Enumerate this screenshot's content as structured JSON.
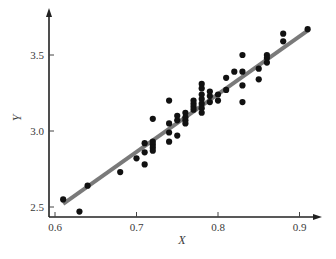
{
  "chart_data": {
    "type": "scatter",
    "title": "",
    "xlabel": "X",
    "ylabel": "Y",
    "xlim": [
      0.6,
      0.92
    ],
    "ylim": [
      2.45,
      3.78
    ],
    "xticks": [
      0.6,
      0.7,
      0.8,
      0.9
    ],
    "xtick_labels": [
      "0.6",
      "0.7",
      "0.8",
      "0.9"
    ],
    "yticks": [
      2.5,
      3.0,
      3.5
    ],
    "ytick_labels": [
      "2.5",
      "3.0",
      "3.5"
    ],
    "grid": false,
    "legend": null,
    "colors": {
      "points": "#111111",
      "fit_line": "#7a7a7a",
      "axis": "#222222"
    },
    "series": [
      {
        "name": "observations",
        "type": "scatter",
        "points": [
          [
            0.61,
            2.55
          ],
          [
            0.63,
            2.47
          ],
          [
            0.64,
            2.64
          ],
          [
            0.68,
            2.73
          ],
          [
            0.7,
            2.82
          ],
          [
            0.71,
            2.78
          ],
          [
            0.71,
            2.86
          ],
          [
            0.71,
            2.92
          ],
          [
            0.72,
            2.91
          ],
          [
            0.72,
            2.93
          ],
          [
            0.72,
            2.89
          ],
          [
            0.72,
            2.87
          ],
          [
            0.72,
            3.08
          ],
          [
            0.74,
            3.2
          ],
          [
            0.74,
            3.05
          ],
          [
            0.74,
            2.99
          ],
          [
            0.74,
            2.93
          ],
          [
            0.75,
            3.07
          ],
          [
            0.75,
            3.1
          ],
          [
            0.75,
            2.97
          ],
          [
            0.76,
            3.07
          ],
          [
            0.76,
            3.12
          ],
          [
            0.76,
            3.09
          ],
          [
            0.76,
            3.05
          ],
          [
            0.77,
            3.2
          ],
          [
            0.77,
            3.18
          ],
          [
            0.77,
            3.16
          ],
          [
            0.77,
            3.14
          ],
          [
            0.78,
            3.31
          ],
          [
            0.78,
            3.28
          ],
          [
            0.78,
            3.24
          ],
          [
            0.78,
            3.21
          ],
          [
            0.78,
            3.18
          ],
          [
            0.78,
            3.15
          ],
          [
            0.78,
            3.12
          ],
          [
            0.79,
            3.26
          ],
          [
            0.79,
            3.23
          ],
          [
            0.79,
            3.19
          ],
          [
            0.8,
            3.24
          ],
          [
            0.8,
            3.2
          ],
          [
            0.81,
            3.35
          ],
          [
            0.81,
            3.27
          ],
          [
            0.82,
            3.39
          ],
          [
            0.83,
            3.5
          ],
          [
            0.83,
            3.39
          ],
          [
            0.83,
            3.3
          ],
          [
            0.83,
            3.19
          ],
          [
            0.85,
            3.41
          ],
          [
            0.85,
            3.34
          ],
          [
            0.86,
            3.5
          ],
          [
            0.86,
            3.48
          ],
          [
            0.86,
            3.45
          ],
          [
            0.88,
            3.64
          ],
          [
            0.88,
            3.59
          ],
          [
            0.91,
            3.67
          ]
        ]
      },
      {
        "name": "fitted line",
        "type": "line",
        "points": [
          [
            0.61,
            2.52
          ],
          [
            0.91,
            3.66
          ]
        ]
      }
    ]
  }
}
